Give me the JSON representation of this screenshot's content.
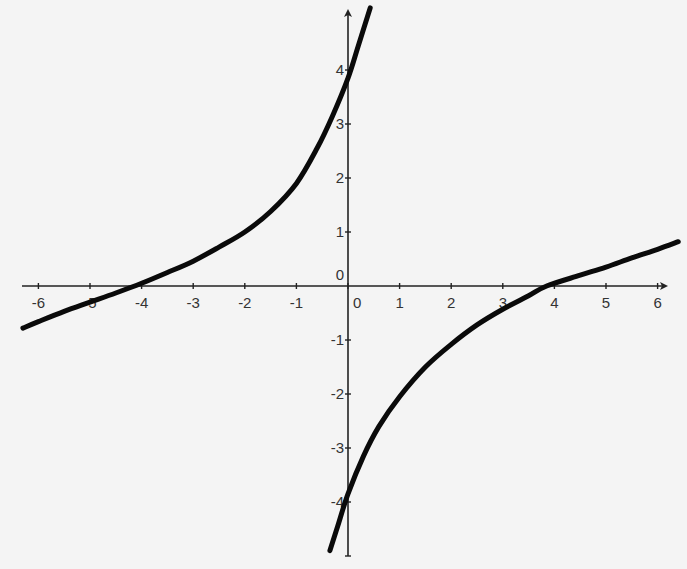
{
  "chart_data": {
    "type": "line",
    "title": "",
    "xlabel": "",
    "ylabel": "",
    "xlim": [
      -6.3,
      6.4
    ],
    "ylim": [
      -4.9,
      5.2
    ],
    "grid": false,
    "legend": null,
    "x_ticks": [
      -6,
      -5,
      -4,
      -3,
      -2,
      -1,
      0,
      1,
      2,
      3,
      4,
      5,
      6
    ],
    "y_ticks": [
      -4,
      -3,
      -2,
      -1,
      0,
      1,
      2,
      3,
      4
    ],
    "x_tick_labels": [
      "-6",
      "-5",
      "-4",
      "-3",
      "-2",
      "-1",
      "0",
      "1",
      "2",
      "3",
      "4",
      "5",
      "6"
    ],
    "y_tick_labels": [
      "-4",
      "-3",
      "-2",
      "-1",
      "0",
      "1",
      "2",
      "3",
      "4"
    ],
    "annotations": [],
    "series": [
      {
        "name": "upper-left branch",
        "color": "#0a0a0a",
        "points": [
          [
            -6.3,
            -0.78
          ],
          [
            -6.0,
            -0.66
          ],
          [
            -5.5,
            -0.47
          ],
          [
            -5.0,
            -0.3
          ],
          [
            -4.5,
            -0.13
          ],
          [
            -4.0,
            0.05
          ],
          [
            -3.5,
            0.25
          ],
          [
            -3.0,
            0.46
          ],
          [
            -2.5,
            0.72
          ],
          [
            -2.0,
            1.0
          ],
          [
            -1.5,
            1.38
          ],
          [
            -1.0,
            1.9
          ],
          [
            -0.6,
            2.55
          ],
          [
            -0.3,
            3.15
          ],
          [
            0.0,
            3.85
          ],
          [
            0.2,
            4.45
          ],
          [
            0.43,
            5.15
          ]
        ]
      },
      {
        "name": "lower-right branch",
        "color": "#0a0a0a",
        "points": [
          [
            -0.35,
            -4.9
          ],
          [
            -0.2,
            -4.45
          ],
          [
            0.0,
            -3.85
          ],
          [
            0.3,
            -3.15
          ],
          [
            0.6,
            -2.6
          ],
          [
            1.0,
            -2.05
          ],
          [
            1.5,
            -1.5
          ],
          [
            2.0,
            -1.08
          ],
          [
            2.5,
            -0.72
          ],
          [
            3.0,
            -0.43
          ],
          [
            3.5,
            -0.18
          ],
          [
            3.85,
            0.0
          ],
          [
            4.5,
            0.2
          ],
          [
            5.0,
            0.35
          ],
          [
            5.5,
            0.52
          ],
          [
            6.0,
            0.68
          ],
          [
            6.4,
            0.82
          ]
        ]
      }
    ]
  }
}
